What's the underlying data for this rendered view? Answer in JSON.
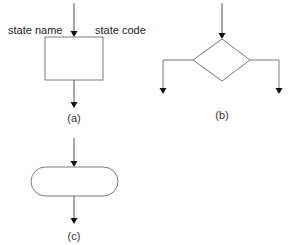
{
  "diagram": {
    "type": "flowchart-symbols",
    "colors": {
      "stroke": "#7a7a7a",
      "arrow": "#111111",
      "text": "#222222",
      "background": "#ffffff"
    },
    "panels": [
      {
        "id": "a",
        "caption": "(a)",
        "shape": "rectangle",
        "labels": {
          "left": "state name",
          "right": "state code"
        },
        "arrows": [
          "in-top",
          "out-bottom"
        ]
      },
      {
        "id": "b",
        "caption": "(b)",
        "shape": "diamond",
        "arrows": [
          "in-top",
          "out-left-down",
          "out-right-down"
        ]
      },
      {
        "id": "c",
        "caption": "(c)",
        "shape": "stadium",
        "arrows": [
          "in-top",
          "out-bottom"
        ]
      }
    ]
  }
}
